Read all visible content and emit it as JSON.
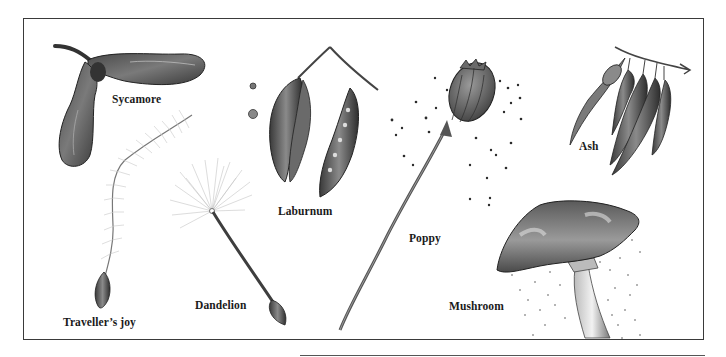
{
  "plate": {
    "background": "#ffffff",
    "frame_color": "#3a3a3a",
    "ink_color": "#2a2a2a"
  },
  "labels": {
    "sycamore": "Sycamore",
    "travellers_joy": "Traveller’s joy",
    "dandelion": "Dandelion",
    "laburnum": "Laburnum",
    "poppy": "Poppy",
    "ash": "Ash",
    "mushroom": "Mushroom"
  },
  "illustrations": [
    {
      "id": "sycamore",
      "kind": "winged-seed"
    },
    {
      "id": "travellers_joy",
      "kind": "feathery-plumed-seed"
    },
    {
      "id": "dandelion",
      "kind": "parachute-seed"
    },
    {
      "id": "laburnum",
      "kind": "seed-pods"
    },
    {
      "id": "poppy",
      "kind": "seed-head-with-seeds"
    },
    {
      "id": "ash",
      "kind": "winged-keys"
    },
    {
      "id": "mushroom",
      "kind": "cap-with-spores"
    }
  ]
}
